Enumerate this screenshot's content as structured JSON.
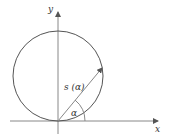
{
  "diagram": {
    "axes": {
      "x_label": "x",
      "y_label": "y"
    },
    "vector_label": "s (α)",
    "angle_label": "α",
    "colors": {
      "stroke": "#444444",
      "axis": "#777777"
    }
  }
}
